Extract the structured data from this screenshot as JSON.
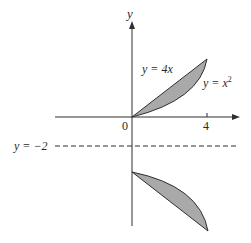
{
  "diagram": {
    "title": "",
    "axes": {
      "x_label": "",
      "y_label": "y",
      "origin_label": "0",
      "x_tick_label": "4"
    },
    "curves": {
      "line_label_var": "y",
      "line_label_rest": " = 4x",
      "parabola_label_var": "y",
      "parabola_label_rest": " = x",
      "parabola_exponent": "2"
    },
    "axis_of_rotation": {
      "label": "y = −2",
      "style": "dashed"
    },
    "regions": [
      {
        "name": "region-between-curves",
        "bounded_by": [
          "y = 4x",
          "y = x^2"
        ],
        "x_range": [
          0,
          4
        ]
      },
      {
        "name": "reflected-region",
        "about": "y = -2",
        "x_range": [
          0,
          4
        ]
      }
    ],
    "colors": {
      "fill": "#a9a9a9",
      "stroke": "#2f2f2f",
      "background": "#ffffff"
    }
  }
}
